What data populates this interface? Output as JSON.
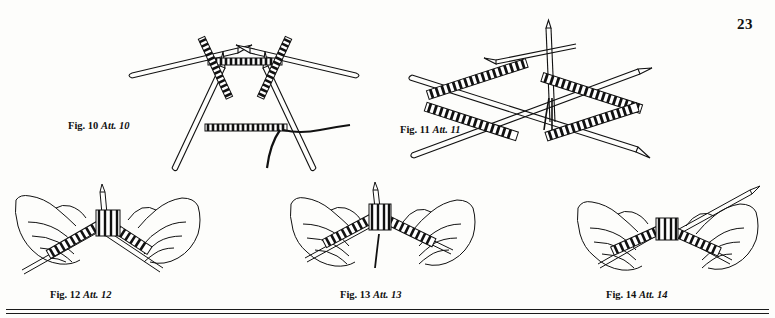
{
  "page": {
    "number": "23",
    "background_color": "#fdfdfb",
    "ink_color": "#111111"
  },
  "figures": [
    {
      "id": "fig-10",
      "label_bold": "Fig. 10",
      "label_italic": "Att. 10",
      "description": "Four double-pointed knitting needles holding a triangular arrangement of cast-on stitches, with working yarn trailing to the lower right"
    },
    {
      "id": "fig-11",
      "label_bold": "Fig. 11",
      "label_italic": "Att. 11",
      "description": "Four double-pointed knitting needles holding a square arrangement of stitches, with a crossed needle and yarn tail at top center"
    },
    {
      "id": "fig-12",
      "label_bold": "Fig. 12",
      "label_italic": "Att. 12",
      "description": "Two hands holding double-pointed needles with knitted stitches, yarn running upward from the right hand"
    },
    {
      "id": "fig-13",
      "label_bold": "Fig. 13",
      "label_italic": "Att. 13",
      "description": "Two hands working with double-pointed needles, yarn hanging down between the needles"
    },
    {
      "id": "fig-14",
      "label_bold": "Fig. 14",
      "label_italic": "Att. 14",
      "description": "Two hands joining stitches on double-pointed needles, needle tip extending to the upper right"
    }
  ]
}
